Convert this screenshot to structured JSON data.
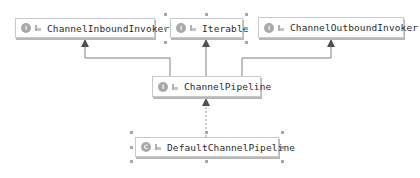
{
  "diagram": {
    "type": "uml-class-hierarchy",
    "colors": {
      "background": "#ffffff",
      "node_border": "#c8c8c8",
      "edge": "#707070",
      "arrowhead": "#505050",
      "badge": "#a8a8a8",
      "selection_handle": "#a8a8a8"
    },
    "nodes": [
      {
        "id": "inbound",
        "label": "ChannelInboundInvoker",
        "kind": "interface",
        "badge": "I",
        "visibility_icon": "public-icon"
      },
      {
        "id": "iterable",
        "label": "Iterable",
        "kind": "interface",
        "badge": "I",
        "visibility_icon": "public-icon",
        "selected": true
      },
      {
        "id": "outbound",
        "label": "ChannelOutboundInvoker",
        "kind": "interface",
        "badge": "I",
        "visibility_icon": "public-icon"
      },
      {
        "id": "pipeline",
        "label": "ChannelPipeline",
        "kind": "interface",
        "badge": "I",
        "visibility_icon": "public-icon"
      },
      {
        "id": "default",
        "label": "DefaultChannelPipeline",
        "kind": "class",
        "badge": "C",
        "visibility_icon": "public-icon",
        "selected": true
      }
    ],
    "edges": [
      {
        "from": "pipeline",
        "to": "inbound",
        "relation": "extends",
        "style": "solid"
      },
      {
        "from": "pipeline",
        "to": "iterable",
        "relation": "extends",
        "style": "solid"
      },
      {
        "from": "pipeline",
        "to": "outbound",
        "relation": "extends",
        "style": "solid"
      },
      {
        "from": "default",
        "to": "pipeline",
        "relation": "implements",
        "style": "dashed"
      }
    ]
  }
}
